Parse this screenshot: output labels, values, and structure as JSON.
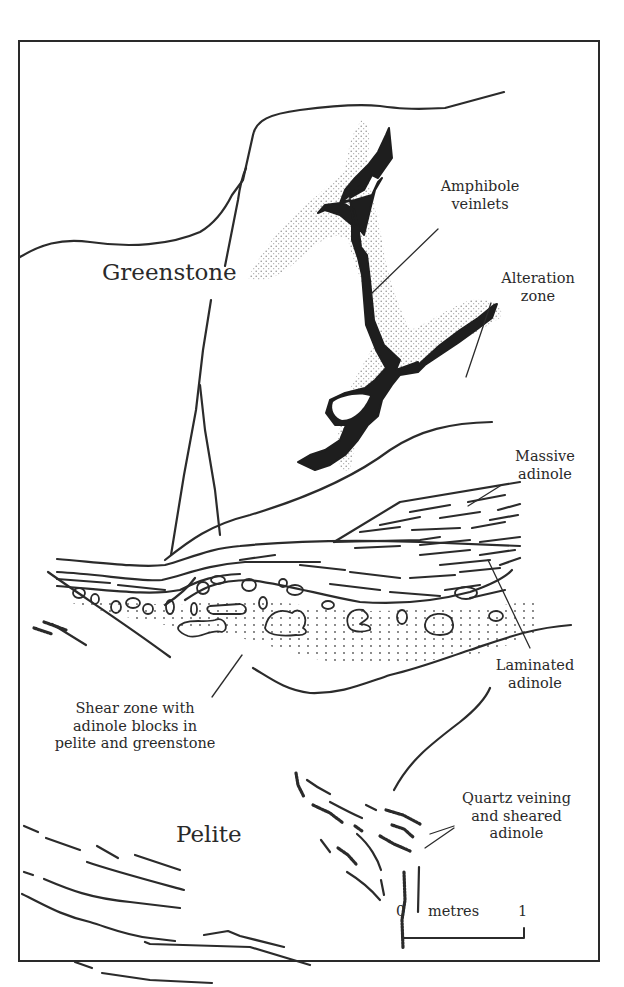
{
  "figure": {
    "type": "geological field sketch",
    "units": {
      "greenstone": "Greenstone",
      "pelite": "Pelite"
    },
    "annotations": {
      "amphibole": [
        "Amphibole",
        "veinlets"
      ],
      "alteration": [
        "Alteration",
        "zone"
      ],
      "massive": [
        "Massive",
        "adinole"
      ],
      "laminated": [
        "Laminated",
        "adinole"
      ],
      "shear": [
        "Shear zone with",
        "adinole blocks in",
        "pelite and greenstone"
      ],
      "quartz": [
        "Quartz veining",
        "and sheared",
        "adinole"
      ]
    },
    "scale_bar": {
      "start": "0",
      "unit": "metres",
      "end": "1"
    },
    "colors": {
      "ink": "#2b2b2b",
      "background": "#ffffff",
      "stipple": "#8a8a8a"
    }
  }
}
